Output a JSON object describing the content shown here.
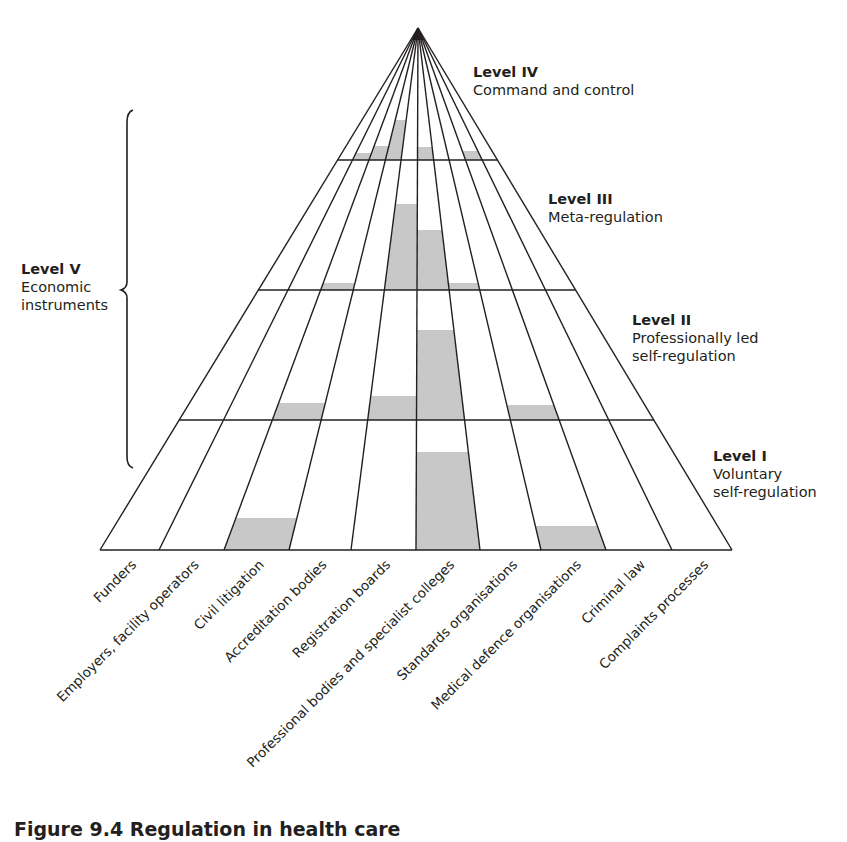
{
  "levels": {
    "level_iv": {
      "title": "Level IV",
      "desc": "Command and control"
    },
    "level_iii": {
      "title": "Level III",
      "desc": "Meta-regulation"
    },
    "level_ii": {
      "title": "Level II",
      "desc_line1": "Professionally led",
      "desc_line2": "self-regulation"
    },
    "level_i": {
      "title": "Level I",
      "desc_line1": "Voluntary",
      "desc_line2": "self-regulation"
    },
    "level_v": {
      "title": "Level V",
      "desc_line1": "Economic",
      "desc_line2": "instruments"
    }
  },
  "categories": [
    "Funders",
    "Employers, facility operators",
    "Civil litigation",
    "Accreditation bodies",
    "Registration boards",
    "Professional bodies and specialist colleges",
    "Standards organisations",
    "Medical defence organisations",
    "Criminal law",
    "Complaints processes"
  ],
  "caption": "Figure 9.4 Regulation in health care",
  "colors": {
    "line": "#231f20",
    "shade": "#c8c8c8",
    "background": "#ffffff"
  },
  "geometry": {
    "apex": [
      418,
      28
    ],
    "base_y": 550,
    "base_x": [
      100,
      159,
      224,
      289,
      351,
      416,
      480,
      541,
      606,
      672,
      732
    ],
    "level_lines_y": [
      160,
      290,
      420
    ]
  },
  "shading": [
    {
      "category": "Employers, facility operators",
      "level": "Level IV",
      "top_y": 153,
      "bottom_y": 160
    },
    {
      "category": "Civil litigation",
      "level": "Level IV",
      "top_y": 146,
      "bottom_y": 160
    },
    {
      "category": "Accreditation bodies",
      "level": "Level IV",
      "top_y": 120,
      "bottom_y": 160
    },
    {
      "category": "Professional bodies and specialist colleges",
      "level": "Level IV",
      "top_y": 147,
      "bottom_y": 160
    },
    {
      "category": "Criminal law",
      "level": "Level IV",
      "top_y": 151,
      "bottom_y": 160
    },
    {
      "category": "Civil litigation",
      "level": "Level III",
      "top_y": 283,
      "bottom_y": 290
    },
    {
      "category": "Registration boards",
      "level": "Level III",
      "top_y": 204,
      "bottom_y": 290
    },
    {
      "category": "Professional bodies and specialist colleges",
      "level": "Level III",
      "top_y": 230,
      "bottom_y": 290
    },
    {
      "category": "Standards organisations",
      "level": "Level III",
      "top_y": 283,
      "bottom_y": 290
    },
    {
      "category": "Civil litigation",
      "level": "Level II",
      "top_y": 403,
      "bottom_y": 420
    },
    {
      "category": "Registration boards",
      "level": "Level II",
      "top_y": 396,
      "bottom_y": 420
    },
    {
      "category": "Professional bodies and specialist colleges",
      "level": "Level II",
      "top_y": 330,
      "bottom_y": 420
    },
    {
      "category": "Medical defence organisations",
      "level": "Level II",
      "top_y": 405,
      "bottom_y": 420
    },
    {
      "category": "Civil litigation",
      "level": "Level I",
      "top_y": 518,
      "bottom_y": 550
    },
    {
      "category": "Professional bodies and specialist colleges",
      "level": "Level I",
      "top_y": 452,
      "bottom_y": 550
    },
    {
      "category": "Medical defence organisations",
      "level": "Level I",
      "top_y": 526,
      "bottom_y": 550
    }
  ]
}
